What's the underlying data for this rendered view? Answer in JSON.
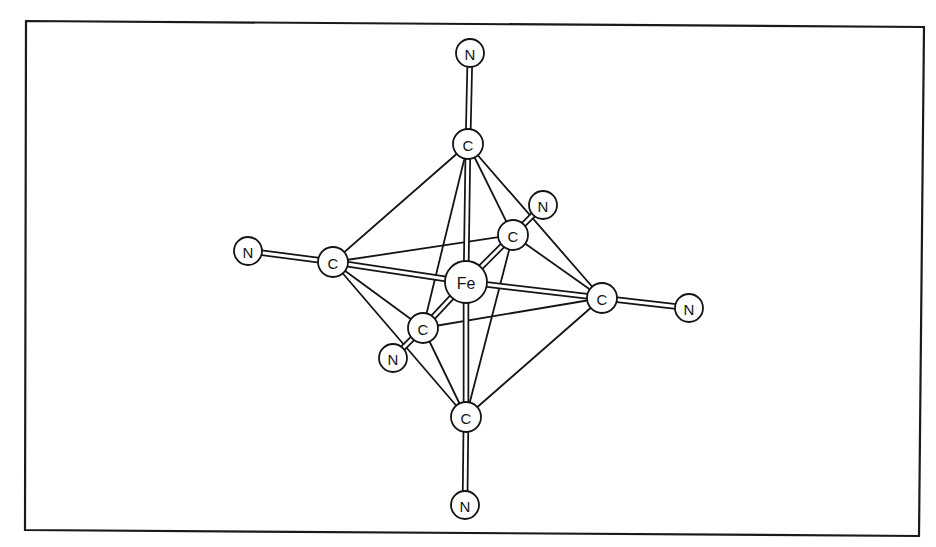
{
  "figure": {
    "central_atom": "Fe",
    "atoms": [
      {
        "id": "Fe",
        "label": "Fe",
        "role": "metal"
      },
      {
        "id": "C_top",
        "label": "C",
        "role": "ligand-carbon"
      },
      {
        "id": "C_bottom",
        "label": "C",
        "role": "ligand-carbon"
      },
      {
        "id": "C_left",
        "label": "C",
        "role": "ligand-carbon"
      },
      {
        "id": "C_right",
        "label": "C",
        "role": "ligand-carbon"
      },
      {
        "id": "C_back",
        "label": "C",
        "role": "ligand-carbon"
      },
      {
        "id": "C_front",
        "label": "C",
        "role": "ligand-carbon"
      },
      {
        "id": "N_top",
        "label": "N",
        "role": "ligand-nitrogen"
      },
      {
        "id": "N_bottom",
        "label": "N",
        "role": "ligand-nitrogen"
      },
      {
        "id": "N_left",
        "label": "N",
        "role": "ligand-nitrogen"
      },
      {
        "id": "N_right",
        "label": "N",
        "role": "ligand-nitrogen"
      },
      {
        "id": "N_back",
        "label": "N",
        "role": "ligand-nitrogen"
      },
      {
        "id": "N_front",
        "label": "N",
        "role": "ligand-nitrogen"
      }
    ],
    "bonds": [
      {
        "from": "Fe",
        "to": "C_top",
        "type": "coordinate"
      },
      {
        "from": "Fe",
        "to": "C_bottom",
        "type": "coordinate"
      },
      {
        "from": "Fe",
        "to": "C_left",
        "type": "coordinate"
      },
      {
        "from": "Fe",
        "to": "C_right",
        "type": "coordinate"
      },
      {
        "from": "Fe",
        "to": "C_back",
        "type": "coordinate"
      },
      {
        "from": "Fe",
        "to": "C_front",
        "type": "coordinate"
      },
      {
        "from": "C_top",
        "to": "N_top",
        "type": "cyanide"
      },
      {
        "from": "C_bottom",
        "to": "N_bottom",
        "type": "cyanide"
      },
      {
        "from": "C_left",
        "to": "N_left",
        "type": "cyanide"
      },
      {
        "from": "C_right",
        "to": "N_right",
        "type": "cyanide"
      },
      {
        "from": "C_back",
        "to": "N_back",
        "type": "cyanide"
      },
      {
        "from": "C_front",
        "to": "N_front",
        "type": "cyanide"
      }
    ],
    "octahedron_edges": [
      {
        "from": "C_top",
        "to": "C_left"
      },
      {
        "from": "C_top",
        "to": "C_back"
      },
      {
        "from": "C_top",
        "to": "C_right"
      },
      {
        "from": "C_top",
        "to": "C_front"
      },
      {
        "from": "C_bottom",
        "to": "C_left"
      },
      {
        "from": "C_bottom",
        "to": "C_back"
      },
      {
        "from": "C_bottom",
        "to": "C_right"
      },
      {
        "from": "C_bottom",
        "to": "C_front"
      },
      {
        "from": "C_left",
        "to": "C_back"
      },
      {
        "from": "C_left",
        "to": "C_front"
      },
      {
        "from": "C_right",
        "to": "C_back"
      },
      {
        "from": "C_right",
        "to": "C_front"
      }
    ]
  }
}
